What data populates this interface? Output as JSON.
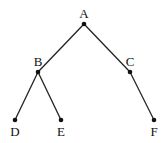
{
  "diagram": {
    "type": "tree",
    "nodes": [
      {
        "id": "A",
        "label": "A",
        "x": 84,
        "y": 24,
        "lx": 84,
        "ly": 18
      },
      {
        "id": "B",
        "label": "B",
        "x": 38,
        "y": 72,
        "lx": 38,
        "ly": 66
      },
      {
        "id": "C",
        "label": "C",
        "x": 130,
        "y": 72,
        "lx": 130,
        "ly": 66
      },
      {
        "id": "D",
        "label": "D",
        "x": 15,
        "y": 120,
        "lx": 15,
        "ly": 136
      },
      {
        "id": "E",
        "label": "E",
        "x": 61,
        "y": 120,
        "lx": 61,
        "ly": 136
      },
      {
        "id": "F",
        "label": "F",
        "x": 154,
        "y": 120,
        "lx": 154,
        "ly": 136
      }
    ],
    "edges": [
      {
        "from": "A",
        "to": "B"
      },
      {
        "from": "A",
        "to": "C"
      },
      {
        "from": "B",
        "to": "D"
      },
      {
        "from": "B",
        "to": "E"
      },
      {
        "from": "C",
        "to": "F"
      }
    ]
  }
}
